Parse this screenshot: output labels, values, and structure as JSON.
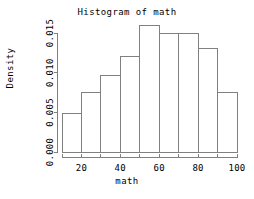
{
  "chart_data": {
    "type": "bar",
    "title": "Histogram of math",
    "xlabel": "math",
    "ylabel": "Density",
    "grid": false,
    "legend": null,
    "bin_width": 10,
    "bin_edges": [
      10,
      20,
      30,
      40,
      50,
      60,
      70,
      80,
      90,
      100
    ],
    "categories": [
      "10-20",
      "20-30",
      "30-40",
      "40-50",
      "50-60",
      "60-70",
      "70-80",
      "80-90",
      "90-100"
    ],
    "values": [
      0.0048,
      0.0075,
      0.0096,
      0.012,
      0.016,
      0.015,
      0.015,
      0.013,
      0.0075
    ],
    "xlim": [
      10,
      100
    ],
    "ylim": [
      0,
      0.016
    ],
    "xticks": [
      20,
      40,
      60,
      80,
      100
    ],
    "xtick_labels": [
      "20",
      "40",
      "60",
      "80",
      "100"
    ],
    "yticks": [
      0.0,
      0.005,
      0.01,
      0.015
    ],
    "ytick_labels": [
      "0.000",
      "0.005",
      "0.010",
      "0.015"
    ],
    "bar_fill": "#ffffff",
    "bar_stroke": "#808080",
    "axis_color": "#808080",
    "text_color": "#000000",
    "background": "#ffffff"
  }
}
